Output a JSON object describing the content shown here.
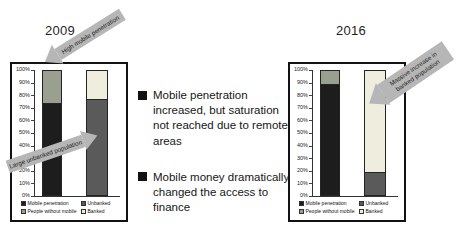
{
  "left": {
    "year": "2009",
    "arrow_top": "High mobile penetration",
    "arrow_side": "Large unbanked population"
  },
  "right": {
    "year": "2016",
    "arrow_line1": "Massive increase in",
    "arrow_line2": "banked population"
  },
  "bullets": [
    "Mobile penetration increased, but saturation not reached due to remote areas",
    "Mobile money dramatically changed the access to finance"
  ],
  "colors": {
    "mobile_penetration": "#1d1d1d",
    "people_without_mobile": "#9aa08f",
    "unbanked": "#5a5a5a",
    "banked": "#efeddd",
    "arrow": "#b6b6b6",
    "axis": "#333333"
  },
  "chart_data": [
    {
      "type": "bar",
      "stacked": true,
      "title": "2009",
      "categories": [
        "Mobile",
        "Banking"
      ],
      "series": [
        {
          "name": "Mobile penetration",
          "color": "#1d1d1d",
          "values": [
            73,
            0
          ]
        },
        {
          "name": "People without mobile",
          "color": "#9aa08f",
          "values": [
            27,
            0
          ]
        },
        {
          "name": "Unbanked",
          "color": "#5a5a5a",
          "values": [
            0,
            77
          ]
        },
        {
          "name": "Banked",
          "color": "#efeddd",
          "values": [
            0,
            23
          ]
        }
      ],
      "ylim": [
        0,
        100
      ],
      "yticks": [
        0,
        10,
        20,
        30,
        40,
        50,
        60,
        70,
        80,
        90,
        100
      ],
      "ytick_suffix": "%",
      "grid": false,
      "legend_position": "bottom"
    },
    {
      "type": "bar",
      "stacked": true,
      "title": "2016",
      "categories": [
        "Mobile",
        "Banking"
      ],
      "series": [
        {
          "name": "Mobile penetration",
          "color": "#1d1d1d",
          "values": [
            89,
            0
          ]
        },
        {
          "name": "People without mobile",
          "color": "#9aa08f",
          "values": [
            11,
            0
          ]
        },
        {
          "name": "Unbanked",
          "color": "#5a5a5a",
          "values": [
            0,
            18
          ]
        },
        {
          "name": "Banked",
          "color": "#efeddd",
          "values": [
            0,
            82
          ]
        }
      ],
      "ylim": [
        0,
        100
      ],
      "yticks": [
        0,
        10,
        20,
        30,
        40,
        50,
        60,
        70,
        80,
        90,
        100
      ],
      "ytick_suffix": "%",
      "grid": false,
      "legend_position": "bottom"
    }
  ]
}
